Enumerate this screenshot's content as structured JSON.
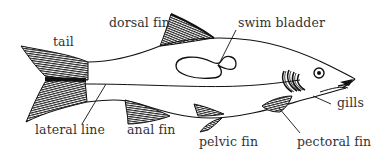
{
  "diagram": {
    "labels": {
      "tail": "tail",
      "dorsal_fin": "dorsal fin",
      "swim_bladder": "swim bladder",
      "gills": "gills",
      "lateral_line": "lateral line",
      "anal_fin": "anal fin",
      "pelvic_fin": "pelvic fin",
      "pectoral_fin": "pectoral fin"
    },
    "colors": {
      "ink": "#1a1a1a",
      "text": "#333333",
      "background": "#ffffff"
    }
  }
}
